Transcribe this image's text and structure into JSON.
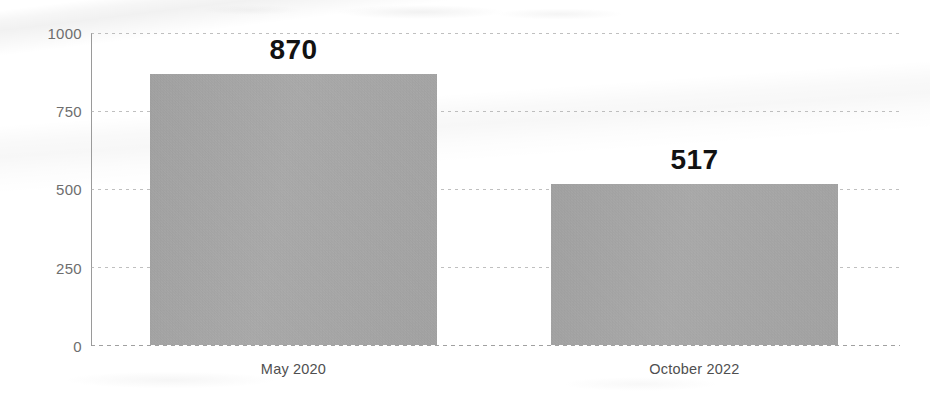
{
  "chart_data": {
    "type": "bar",
    "title": "",
    "subtitle": "",
    "xlabel": "",
    "ylabel": "",
    "categories": [
      "May 2020",
      "October 2022"
    ],
    "values": [
      870,
      517
    ],
    "data_labels": [
      "870",
      "517"
    ],
    "ylim": [
      0,
      1000
    ],
    "yticks": [
      1000,
      750,
      500,
      250,
      0
    ],
    "ytick_labels": [
      "1000",
      "750",
      "500",
      "250",
      "0"
    ],
    "grid": true,
    "grid_style": "dotted-horizontal",
    "legend": "none",
    "bar_color": "#a9a9a9",
    "label_color": "#121212",
    "tick_color": "#6e6e6e",
    "axis_color": "#9a9a9a",
    "background_color": "#ffffff",
    "appearance": "scanned-grayscale"
  },
  "axis": {
    "y_ticks": [
      {
        "label": "1000",
        "value": 1000
      },
      {
        "label": "750",
        "value": 750
      },
      {
        "label": "500",
        "value": 500
      },
      {
        "label": "250",
        "value": 250
      },
      {
        "label": "0",
        "value": 0
      }
    ]
  },
  "bars": [
    {
      "category": "May 2020",
      "value": 870,
      "value_label": "870"
    },
    {
      "category": "October 2022",
      "value": 517,
      "value_label": "517"
    }
  ]
}
